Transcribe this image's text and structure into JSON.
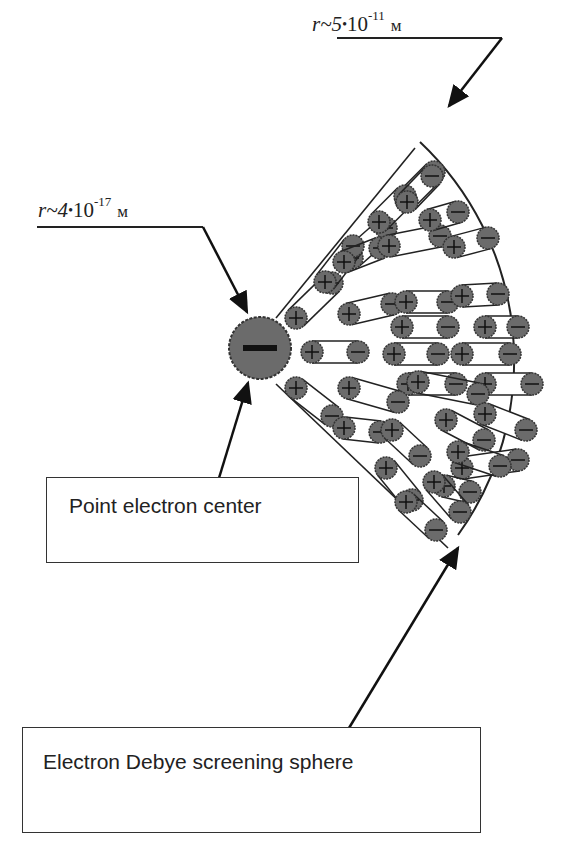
{
  "figure": {
    "type": "physics-diagram"
  },
  "labels": {
    "outer_radius": {
      "symbol": "r",
      "approx": "~",
      "mantissa": "5",
      "dot": "•",
      "base": "10",
      "exponent": "-11",
      "unit": "м"
    },
    "inner_radius": {
      "symbol": "r",
      "approx": "~",
      "mantissa": "4",
      "dot": "•",
      "base": "10",
      "exponent": "-17",
      "unit": "м"
    },
    "center_charge_sign": "−",
    "plus_sign": "+",
    "minus_sign": "−"
  },
  "callouts": {
    "point_center": "Point electron center",
    "debye_sphere": "Electron Debye screening sphere"
  },
  "colors": {
    "charge_fill": "#6b6b6b",
    "stroke": "#222222",
    "background": "#ffffff"
  }
}
